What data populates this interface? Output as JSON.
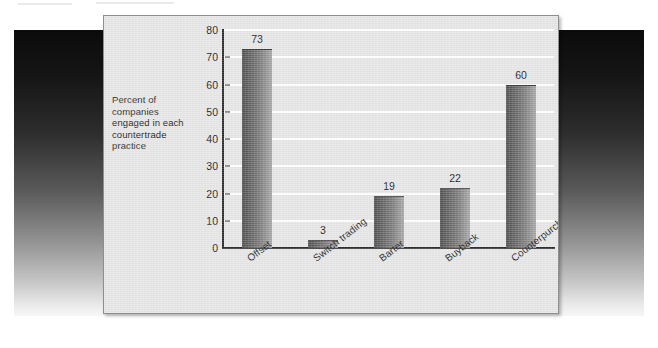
{
  "chart_data": {
    "type": "bar",
    "title": "",
    "subtitle": "",
    "xlabel": "",
    "ylabel": "Percent of companies engaged in each countertrade practice",
    "categories": [
      "Offset",
      "Switch trading",
      "Barter",
      "Buyback",
      "Counterpurchase"
    ],
    "values": [
      73,
      3,
      19,
      22,
      60
    ],
    "value_labels": [
      "73",
      "3",
      "19",
      "22",
      "60"
    ],
    "ylim": [
      0,
      80
    ],
    "ytick_labels": [
      "0",
      "10",
      "20",
      "30",
      "40",
      "50",
      "60",
      "70",
      "80"
    ],
    "ytick_values": [
      0,
      10,
      20,
      30,
      40,
      50,
      60,
      70,
      80
    ],
    "grid": "horizontal-white-lines",
    "legend": "none",
    "legend_position": "none",
    "bar_fill": "#7d7d7d",
    "gridline_color": "#ffffff",
    "axis_color": "#2b2b2b",
    "panel_background": "#e6e6e6"
  },
  "caption": {
    "axis_note": "Percent of companies engaged in each countertrade practice"
  },
  "colors": {
    "backdrop_top": "#0b0b0b",
    "backdrop_bottom": "#f7f7f7",
    "panel_border": "#8e8e8e",
    "text": "#1c1c1c"
  }
}
